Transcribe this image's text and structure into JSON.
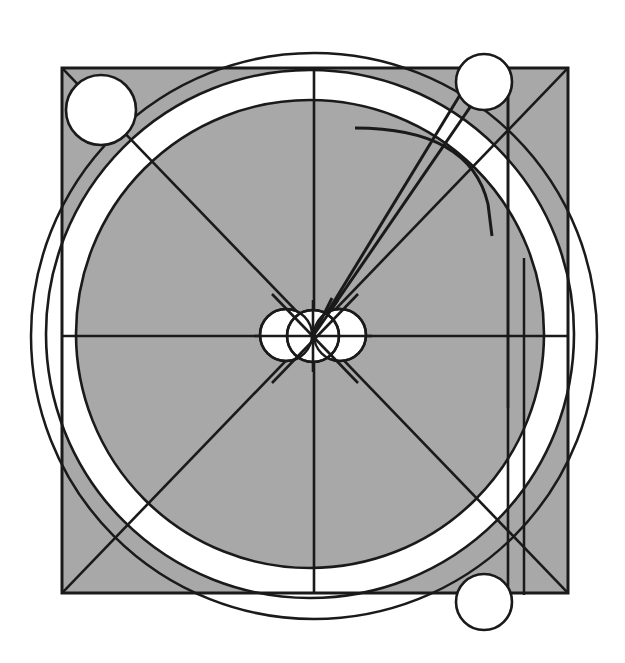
{
  "document": {
    "title": "Geometric Composition",
    "kind": "abstract-geometric-line-drawing",
    "width": 625,
    "height": 663,
    "background_color": "#ffffff"
  },
  "palette": {
    "stroke": "#1a1a1a",
    "gray_fill": "#a8a8a8",
    "white_fill": "#ffffff",
    "page_background": "#ffffff"
  },
  "geometry": {
    "square": {
      "label": "gray-square",
      "x": 62,
      "y": 68,
      "width": 506,
      "height": 525,
      "fill": "#a8a8a8",
      "stroke_width": 3
    },
    "outer_circle": {
      "label": "outer-thin-circle",
      "cx": 314,
      "cy": 336,
      "r": 283,
      "fill": "none",
      "stroke_width": 2.5
    },
    "white_ring": {
      "label": "white-annulus-band",
      "cx": 310,
      "cy": 334,
      "outer_r": 264,
      "inner_r": 234,
      "fill": "#ffffff",
      "stroke_width": 2.5
    },
    "inner_disc": {
      "label": "gray-inner-disc",
      "cx": 310,
      "cy": 334,
      "r": 234,
      "fill": "#a8a8a8",
      "stroke_width": 2.5
    },
    "center_circles": [
      {
        "label": "center-circle-left",
        "cx": 286,
        "cy": 335,
        "r": 26
      },
      {
        "label": "center-circle-middle",
        "cx": 313,
        "cy": 336,
        "r": 26
      },
      {
        "label": "center-circle-right",
        "cx": 340,
        "cy": 335,
        "r": 26
      }
    ],
    "corner_circles": [
      {
        "label": "corner-circle-top-left",
        "cx": 101,
        "cy": 110,
        "r": 35
      },
      {
        "label": "corner-circle-top-right",
        "cx": 484,
        "cy": 82,
        "r": 28
      },
      {
        "label": "corner-circle-bottom-right",
        "cx": 484,
        "cy": 602,
        "r": 28
      }
    ],
    "axis_lines": {
      "horizontal": {
        "label": "horizontal-center-line",
        "x1": 62,
        "y1": 336,
        "x2": 568,
        "y2": 336
      },
      "vertical": {
        "label": "vertical-center-line",
        "x1": 314,
        "y1": 68,
        "x2": 314,
        "y2": 593
      }
    },
    "diagonals": [
      {
        "label": "diagonal-tl-br",
        "x1": 62,
        "y1": 68,
        "x2": 568,
        "y2": 593
      },
      {
        "label": "diagonal-bl-tr",
        "x1": 62,
        "y1": 593,
        "x2": 568,
        "y2": 68
      }
    ],
    "radial_lines": [
      {
        "label": "radial-line-steep-upper-right",
        "x1": 313,
        "y1": 336,
        "x2": 497,
        "y2": 68
      },
      {
        "label": "radial-line-shallow-upper-right",
        "x1": 313,
        "y1": 336,
        "x2": 474,
        "y2": 72
      }
    ],
    "free_arc": {
      "label": "free-floating-arc",
      "start": [
        355,
        128
      ],
      "control": [
        470,
        128
      ],
      "end": [
        492,
        236
      ],
      "stroke_width": 3
    },
    "vertical_segments": [
      {
        "label": "vertical-segment-long",
        "x": 508,
        "y1": 68,
        "y2": 408,
        "stroke_width": 2.5
      },
      {
        "label": "vertical-segment-short",
        "x": 524,
        "y1": 258,
        "y2": 595,
        "stroke_width": 2.5
      }
    ],
    "right_panel_edge": {
      "label": "right-inner-vertical-edge",
      "x": 508,
      "y1": 68,
      "y2": 593
    }
  },
  "chart_data": {
    "type": "scatter",
    "xlabel": "",
    "ylabel": "",
    "categories": [
      "gray-square",
      "outer-circle",
      "white-ring-band",
      "gray-inner-disc",
      "center-circle-cluster",
      "corner-circles",
      "diagonals",
      "axis-lines",
      "radial-lines",
      "free-arc",
      "vertical-segments"
    ],
    "values": [
      1,
      1,
      1,
      1,
      3,
      3,
      2,
      2,
      2,
      1,
      2
    ],
    "xlim": [
      0,
      625
    ],
    "ylim": [
      0,
      663
    ],
    "grid": false,
    "legend": "none"
  }
}
